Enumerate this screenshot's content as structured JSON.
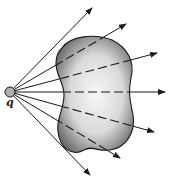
{
  "diagram": {
    "type": "gauss-law-field-lines",
    "charge": {
      "label": "q",
      "cx": 10,
      "cy": 92,
      "r": 5,
      "fill": "#b0b0b0"
    },
    "surface": {
      "description": "closed surface (kidney-shaped) with shading",
      "path": "M62,48 C70,36 95,33 112,40 C128,48 135,62 131,78 C128,92 130,100 133,115 C136,132 126,148 110,150 C98,152 92,145 84,150 C72,157 60,148 58,132 C56,118 64,110 64,95 C64,82 55,74 56,62 C57,54 58,52 62,48 Z",
      "shade_dark": "#6a6a6a",
      "shade_light": "#f4f4f4"
    },
    "field_lines": [
      {
        "x2": 92,
        "y2": 8
      },
      {
        "x2": 126,
        "y2": 24
      },
      {
        "x2": 157,
        "y2": 53
      },
      {
        "x2": 165,
        "y2": 92
      },
      {
        "x2": 154,
        "y2": 132
      },
      {
        "x2": 120,
        "y2": 158
      },
      {
        "x2": 90,
        "y2": 175
      }
    ],
    "line_color": "#1a1a1a"
  }
}
